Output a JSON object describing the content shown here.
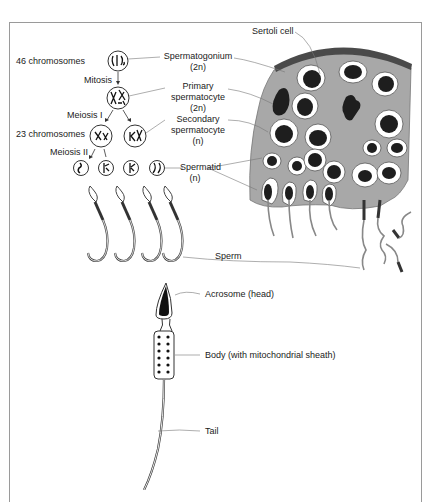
{
  "diagram": {
    "chromosome_counts": {
      "diploid": "46 chromosomes",
      "haploid": "23 chromosomes"
    },
    "processes": {
      "mitosis": "Mitosis",
      "meiosis1": "Meiosis I",
      "meiosis2": "Meiosis II"
    },
    "stages": {
      "spermatogonium": {
        "name": "Spermatogonium",
        "ploidy": "(2n)"
      },
      "primary": {
        "name": "Primary",
        "name2": "spermatocyte",
        "ploidy": "(2n)"
      },
      "secondary": {
        "name": "Secondary",
        "name2": "spermatocyte",
        "ploidy": "(n)"
      },
      "spermatid": {
        "name": "Spermatid",
        "ploidy": "(n)"
      },
      "sperm": {
        "name": "Sperm"
      }
    },
    "tubule": {
      "sertoli_label": "Sertoli cell"
    },
    "sperm_anatomy": {
      "head": "Acrosome (head)",
      "body": "Body (with mitochondrial sheath)",
      "tail": "Tail"
    },
    "colors": {
      "tubule_fill": "#a8a8a8",
      "nucleus": "#1e1e1e",
      "membrane": "#4a4a4a",
      "frame": "#9a9a9a"
    }
  }
}
